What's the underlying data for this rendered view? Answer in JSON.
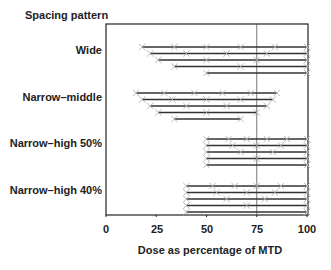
{
  "chart_data": {
    "type": "scatter",
    "title": "Spacing pattern",
    "xlabel": "Dose as percentage of MTD",
    "ylabel": "Spacing pattern",
    "xlim": [
      0,
      100
    ],
    "xticks": [
      0,
      25,
      50,
      75,
      100
    ],
    "reference_line_x": 75,
    "grid": false,
    "legend": null,
    "groups": [
      {
        "name": "Wide",
        "rows": [
          [
            18,
            34,
            50,
            67,
            84,
            100
          ],
          [
            22,
            40,
            60,
            80,
            100
          ],
          [
            26,
            50,
            75,
            100
          ],
          [
            34,
            67,
            100
          ],
          [
            50,
            100
          ]
        ]
      },
      {
        "name": "Narrow–middle",
        "rows": [
          [
            15,
            29,
            44,
            58,
            72,
            85
          ],
          [
            18,
            33,
            50,
            67,
            83
          ],
          [
            22,
            40,
            60,
            80
          ],
          [
            26,
            50,
            75
          ],
          [
            34,
            67
          ]
        ]
      },
      {
        "name": "Narrow–high 50%",
        "rows": [
          [
            50,
            61,
            70,
            80,
            90,
            100
          ],
          [
            50,
            63,
            75,
            87,
            100
          ],
          [
            50,
            67,
            83,
            100
          ],
          [
            50,
            75,
            100
          ],
          [
            50,
            100
          ]
        ]
      },
      {
        "name": "Narrow–high 40%",
        "rows": [
          [
            40,
            53,
            64,
            75,
            87,
            100
          ],
          [
            40,
            55,
            70,
            84,
            100
          ],
          [
            40,
            60,
            79,
            100
          ],
          [
            40,
            70,
            100
          ],
          [
            40,
            100
          ]
        ]
      }
    ]
  },
  "labels": {
    "title": "Spacing pattern",
    "xlabel": "Dose as percentage of MTD",
    "ticks": [
      "0",
      "25",
      "50",
      "75",
      "100"
    ],
    "groups": [
      "Wide",
      "Narrow–middle",
      "Narrow–high 50%",
      "Narrow–high 40%"
    ]
  },
  "colors": {
    "axis": "#222222",
    "line": "#333333",
    "marker": "#b0b0b0",
    "refline": "#555555"
  }
}
